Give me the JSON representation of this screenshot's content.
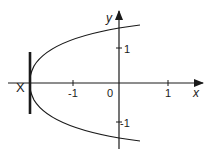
{
  "figure": {
    "type": "parabola-graph",
    "equation_shape": "sideways parabola opening right",
    "point_label": "X",
    "axis_labels": {
      "x": "x",
      "y": "y"
    },
    "ticks": {
      "x": [
        {
          "value": -1,
          "label": "-1"
        },
        {
          "value": 1,
          "label": "1"
        }
      ],
      "y": [
        {
          "value": 1,
          "label": "1"
        },
        {
          "value": -1,
          "label": "-1"
        }
      ],
      "origin_label": "0"
    },
    "vertex": {
      "x": -1.9,
      "y": 0
    },
    "directrix_segment": {
      "x": -1.9,
      "y_from": -0.85,
      "y_to": 0.85
    },
    "colors": {
      "ink": "#1a1a1a",
      "background": "#ffffff"
    }
  }
}
